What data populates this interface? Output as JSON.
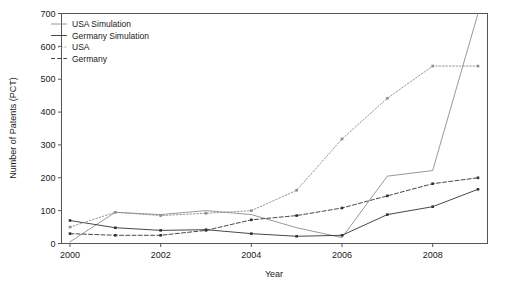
{
  "chart_data": {
    "type": "line",
    "title": "",
    "xlabel": "Year",
    "ylabel": "Number of Patents (PCT)",
    "xlim": [
      2000,
      2009
    ],
    "ylim": [
      0,
      700
    ],
    "yticks": [
      0,
      100,
      200,
      300,
      400,
      500,
      600,
      700
    ],
    "xticks": [
      2000,
      2002,
      2004,
      2006,
      2008
    ],
    "xtick_labels": [
      "2000",
      "2002",
      "2004",
      "2006",
      "2008"
    ],
    "ytick_labels": [
      "0",
      "100",
      "200",
      "300",
      "400",
      "500",
      "600",
      "700"
    ],
    "grid": false,
    "legend_position": "top-left",
    "x": [
      2000,
      2001,
      2002,
      2003,
      2004,
      2005,
      2006,
      2007,
      2008,
      2009
    ],
    "series": [
      {
        "name": "USA Simulation",
        "style": "solid",
        "color": "#8c8c8c",
        "width": 0.9,
        "markers": false,
        "values": [
          5,
          95,
          88,
          100,
          88,
          48,
          18,
          205,
          222,
          700
        ]
      },
      {
        "name": "Germany Simulation",
        "style": "solid",
        "color": "#333333",
        "width": 0.9,
        "markers": true,
        "values": [
          70,
          48,
          40,
          42,
          30,
          22,
          25,
          88,
          112,
          165
        ]
      },
      {
        "name": "USA",
        "style": "dotted",
        "color": "#8c8c8c",
        "width": 0.9,
        "markers": true,
        "values": [
          50,
          95,
          85,
          92,
          100,
          162,
          318,
          442,
          540,
          540
        ]
      },
      {
        "name": "Germany",
        "style": "dashed",
        "color": "#333333",
        "width": 0.9,
        "markers": true,
        "values": [
          30,
          25,
          25,
          40,
          72,
          85,
          108,
          145,
          182,
          200
        ]
      }
    ]
  },
  "legend": {
    "entries": [
      {
        "label": "USA Simulation"
      },
      {
        "label": "Germany Simulation"
      },
      {
        "label": "USA"
      },
      {
        "label": "Germany"
      }
    ]
  },
  "axes": {
    "x_title": "Year",
    "y_title": "Number of Patents (PCT)"
  }
}
